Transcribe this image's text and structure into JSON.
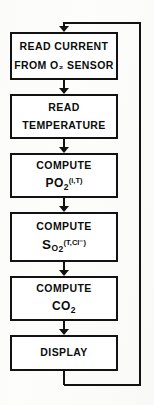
{
  "diagram": {
    "type": "flowchart",
    "orientation": "top-to-bottom-with-feedback-loop",
    "colors": {
      "stroke": "#121212",
      "box_fill": "#ffffff",
      "background": "#fdfdfb"
    },
    "nodes": [
      {
        "id": "read-current",
        "line1": "READ CURRENT",
        "line2": "FROM O₂ SENSOR"
      },
      {
        "id": "read-temperature",
        "line1": "READ",
        "line2": "TEMPERATURE"
      },
      {
        "id": "compute-po2",
        "line1": "COMPUTE",
        "formula_base": "PO",
        "formula_sub": "2",
        "formula_sup": "(i,T)"
      },
      {
        "id": "compute-so2",
        "line1": "COMPUTE",
        "formula_base": "S",
        "formula_base2": "O",
        "formula_sub": "2",
        "formula_sup": "(T,Cl⁻)"
      },
      {
        "id": "compute-co2",
        "line1": "COMPUTE",
        "formula_base": "CO",
        "formula_sub": "2"
      },
      {
        "id": "display",
        "line1": "DISPLAY"
      }
    ],
    "connectors": {
      "arrow_count": 6,
      "feedback_label": ""
    }
  }
}
